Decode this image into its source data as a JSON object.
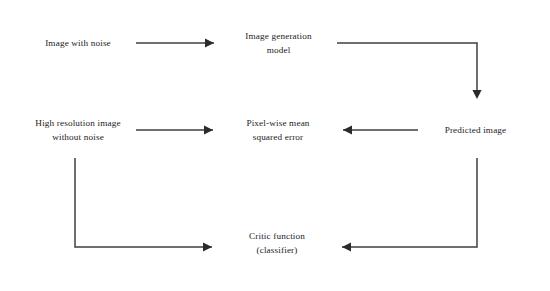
{
  "diagram": {
    "background_color": "#ffffff",
    "box_border_color": "#4a4a4a",
    "edge_color": "#3f3f3f",
    "arrow_color": "#2b2b2b",
    "nodes": [
      {
        "id": "image-with-noise",
        "label": "Image with noise",
        "x": 20,
        "y": 16,
        "width": 116,
        "height": 55
      },
      {
        "id": "image-generation-model",
        "label": "Image generation\nmodel",
        "x": 220,
        "y": 16,
        "width": 117,
        "height": 55
      },
      {
        "id": "high-resolution-image",
        "label": "High resolution image\nwithout noise",
        "x": 20,
        "y": 103,
        "width": 116,
        "height": 55
      },
      {
        "id": "pixel-wise-mse",
        "label": "Pixel-wise mean\nsquared error",
        "x": 219,
        "y": 103,
        "width": 118,
        "height": 55
      },
      {
        "id": "predicted-image",
        "label": "Predicted  image",
        "x": 418,
        "y": 103,
        "width": 115,
        "height": 55
      },
      {
        "id": "critic-function",
        "label": "Critic function\n(classifier)",
        "x": 218,
        "y": 215,
        "width": 118,
        "height": 57
      }
    ],
    "edges": [
      {
        "id": "edge-noise-to-generation",
        "from": "image-with-noise",
        "to": "image-generation-model",
        "path": "M 136 43 L 214 43",
        "arrow": {
          "x": 214,
          "y": 43,
          "direction": "right"
        }
      },
      {
        "id": "edge-generation-to-predicted",
        "from": "image-generation-model",
        "to": "predicted-image",
        "path": "M 337 43 L 477 43 L 477 97",
        "arrow": {
          "x": 477,
          "y": 99,
          "direction": "down"
        }
      },
      {
        "id": "edge-highres-to-mse",
        "from": "high-resolution-image",
        "to": "pixel-wise-mse",
        "path": "M 136 130 L 213 130",
        "arrow": {
          "x": 213,
          "y": 130,
          "direction": "right"
        }
      },
      {
        "id": "edge-predicted-to-mse",
        "from": "predicted-image",
        "to": "pixel-wise-mse",
        "path": "M 418 130 L 343 130",
        "arrow": {
          "x": 343,
          "y": 130,
          "direction": "left"
        }
      },
      {
        "id": "edge-highres-to-critic",
        "from": "high-resolution-image",
        "to": "critic-function",
        "path": "M 75 158 L 75 247 L 212 247",
        "arrow": {
          "x": 212,
          "y": 247,
          "direction": "right"
        }
      },
      {
        "id": "edge-predicted-to-critic",
        "from": "predicted-image",
        "to": "critic-function",
        "path": "M 477 158 L 477 247 L 342 247",
        "arrow": {
          "x": 342,
          "y": 247,
          "direction": "left"
        }
      }
    ]
  }
}
